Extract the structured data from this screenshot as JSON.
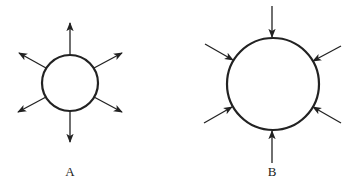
{
  "diagram": {
    "figures": [
      {
        "id": "A",
        "label": "A",
        "description": "small circle with arrows pointing outward",
        "center": [
          70,
          83
        ],
        "radius": 28,
        "arrow_direction": "outward",
        "arrows": [
          {
            "from": [
              70,
              55
            ],
            "to": [
              70,
              23
            ]
          },
          {
            "from": [
              46,
              68
            ],
            "to": [
              19,
              53
            ]
          },
          {
            "from": [
              94,
              68
            ],
            "to": [
              122,
              53
            ]
          },
          {
            "from": [
              46,
              97
            ],
            "to": [
              18,
              112
            ]
          },
          {
            "from": [
              94,
              97
            ],
            "to": [
              122,
              112
            ]
          },
          {
            "from": [
              70,
              111
            ],
            "to": [
              70,
              142
            ]
          }
        ],
        "label_pos": [
          70,
          164
        ]
      },
      {
        "id": "B",
        "label": "B",
        "description": "large circle with arrows pointing inward",
        "center": [
          273,
          84
        ],
        "radius": 46,
        "arrow_direction": "inward",
        "arrows": [
          {
            "from": [
              272,
              6
            ],
            "to": [
              272,
              37
            ]
          },
          {
            "from": [
              205,
              44
            ],
            "to": [
              233,
              60
            ]
          },
          {
            "from": [
              341,
              46
            ],
            "to": [
              313,
              61
            ]
          },
          {
            "from": [
              204,
              123
            ],
            "to": [
              232,
              107
            ]
          },
          {
            "from": [
              341,
              123
            ],
            "to": [
              313,
              107
            ]
          },
          {
            "from": [
              272,
              163
            ],
            "to": [
              272,
              131
            ]
          }
        ],
        "label_pos": [
          272,
          164
        ]
      }
    ],
    "colors": {
      "stroke": "#222222",
      "background": "#ffffff"
    }
  }
}
